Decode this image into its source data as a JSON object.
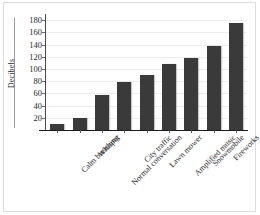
{
  "chart_data": {
    "type": "bar",
    "title": "",
    "xlabel": "",
    "ylabel": "Decibels",
    "ylim": [
      0,
      190
    ],
    "yticks": [
      20,
      40,
      60,
      80,
      100,
      120,
      140,
      160,
      180
    ],
    "grid": true,
    "legend": null,
    "bar_color": "#3a3a3a",
    "categories": [
      "Calm breathing",
      "Whisper",
      "Normal conversation",
      "City traffic",
      "Lawn mower",
      "Amplified music",
      "Snowmobile",
      "Fireworks",
      "Airplane takeoff"
    ],
    "values": [
      10,
      20,
      58,
      78,
      90,
      108,
      118,
      138,
      176
    ]
  },
  "axes": {
    "y_title": "Decibels",
    "tick_labels": [
      "180",
      "160",
      "140",
      "120",
      "100",
      "80",
      "60",
      "40",
      "20"
    ]
  },
  "labels": {
    "c0": "Calm breathing",
    "c1": "Whisper",
    "c2": "Normal conversation",
    "c3": "City traffic",
    "c4": "Lawn mower",
    "c5": "Amplified music",
    "c6": "Snowmobile",
    "c7": "Fireworks",
    "c8": "Airplane takeoff"
  }
}
